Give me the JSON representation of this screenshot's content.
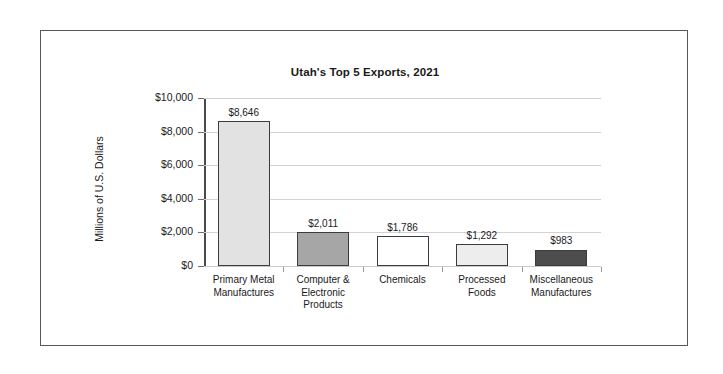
{
  "chart_data": {
    "type": "bar",
    "title": "Utah's Top 5 Exports, 2021",
    "xlabel": "",
    "ylabel": "Millions of U.S. Dollars",
    "ylim": [
      0,
      10000
    ],
    "ytick_labels": [
      "$10,000",
      "$8,000",
      "$6,000",
      "$4,000",
      "$2,000",
      "$0"
    ],
    "ytick_values": [
      10000,
      8000,
      6000,
      4000,
      2000,
      0
    ],
    "grid": true,
    "legend": "none",
    "categories": [
      "Primary Metal Manufactures",
      "Computer & Electronic Products",
      "Chemicals",
      "Processed Foods",
      "Miscellaneous Manufactures"
    ],
    "category_lines": [
      [
        "Primary Metal",
        "Manufactures"
      ],
      [
        "Computer &",
        "Electronic",
        "Products"
      ],
      [
        "Chemicals"
      ],
      [
        "Processed",
        "Foods"
      ],
      [
        "Miscellaneous",
        "Manufactures"
      ]
    ],
    "values": [
      8646,
      2011,
      1786,
      1292,
      983
    ],
    "value_labels": [
      "$8,646",
      "$2,011",
      "$1,786",
      "$1,292",
      "$983"
    ],
    "bar_colors": [
      "#e2e2e2",
      "#a6a6a6",
      "#ffffff",
      "#ededed",
      "#4d4d4d"
    ],
    "bar_edge_color": "#3c3c3c"
  }
}
